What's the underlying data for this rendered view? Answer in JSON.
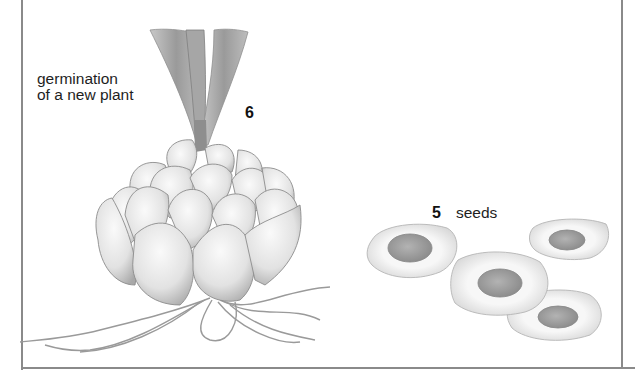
{
  "figure": {
    "stages": [
      {
        "number": "6",
        "caption_line1": "germination",
        "caption_line2": "of a new plant",
        "illustration": "sprouting-bulb"
      },
      {
        "number": "5",
        "caption": "seeds",
        "illustration": "seed-cluster",
        "seed_count": 4
      }
    ]
  },
  "colors": {
    "frame": "#8a8a8a",
    "text": "#1e1e1e",
    "petal_light": "#f2f2f2",
    "petal_shade": "#b9b9b9",
    "seed_core": "#9c9c9c",
    "seed_rim": "#e8e8e8"
  }
}
